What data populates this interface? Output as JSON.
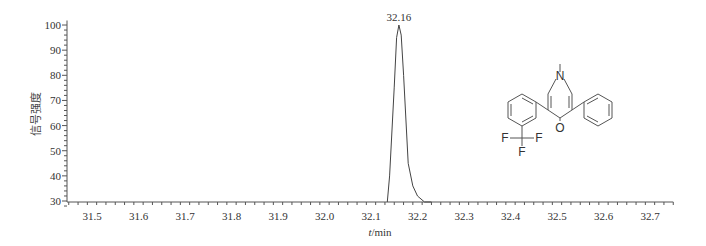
{
  "chart_data": {
    "type": "line",
    "title": "",
    "xlabel": "t/min",
    "ylabel": "信号强度",
    "xlim": [
      31.45,
      32.75
    ],
    "ylim": [
      28,
      101
    ],
    "x_ticks": [
      31.5,
      31.6,
      31.7,
      31.8,
      31.9,
      32.0,
      32.1,
      32.2,
      32.3,
      32.4,
      32.5,
      32.6,
      32.7
    ],
    "x_tick_labels": [
      "31.5",
      "31.6",
      "31.7",
      "31.8",
      "31.9",
      "32.0",
      "32.1",
      "32.2",
      "32.3",
      "32.4",
      "32.5",
      "32.6",
      "32.7"
    ],
    "y_ticks": [
      30,
      40,
      50,
      60,
      70,
      80,
      90,
      100
    ],
    "y_tick_labels": [
      "30",
      "40",
      "50",
      "60",
      "70",
      "80",
      "90",
      "100"
    ],
    "grid": false,
    "legend": null,
    "series": [
      {
        "name": "chromatogram",
        "x": [
          32.135,
          32.14,
          32.15,
          32.155,
          32.16,
          32.165,
          32.17,
          32.18,
          32.19,
          32.2,
          32.215,
          32.23
        ],
        "y": [
          28,
          40,
          75,
          95,
          100,
          96,
          80,
          45,
          36,
          32,
          29.5,
          28
        ]
      }
    ],
    "annotations": [
      {
        "text": "32.16",
        "x": 32.16,
        "y": 100,
        "type": "peak-label"
      }
    ],
    "inset": {
      "type": "chemical-structure",
      "atom_labels": [
        "N",
        "O",
        "F",
        "F",
        "F"
      ],
      "description": "1-methyl-3-phenyl-5-(3-(trifluoromethyl)phenyl)pyridin-4(1H)-one"
    }
  }
}
